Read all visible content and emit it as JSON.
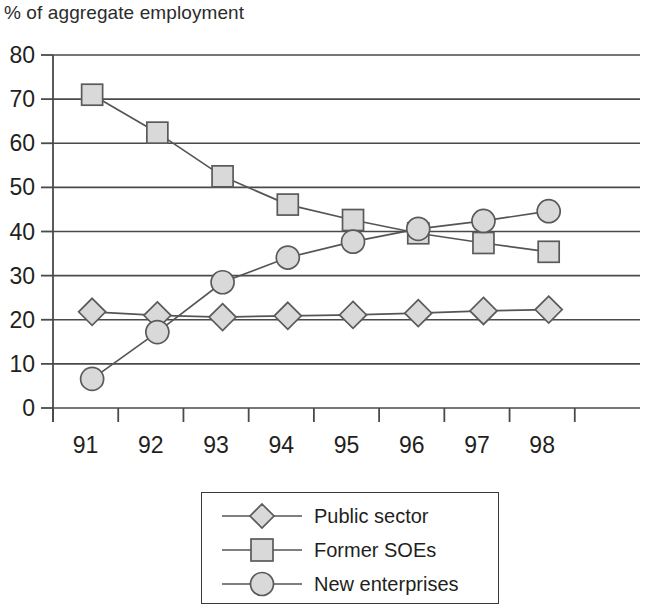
{
  "chart_data": {
    "type": "line",
    "title": "% of aggregate employment",
    "xlabel": "",
    "ylabel": "",
    "categories": [
      "91",
      "92",
      "93",
      "94",
      "95",
      "96",
      "97",
      "98"
    ],
    "ylim": [
      0,
      80
    ],
    "y_ticks": [
      0,
      10,
      20,
      30,
      40,
      50,
      60,
      70,
      80
    ],
    "grid": true,
    "legend_position": "bottom-center",
    "series": [
      {
        "name": "Public sector",
        "marker": "diamond",
        "values": [
          21.8,
          21.0,
          20.6,
          20.9,
          21.1,
          21.5,
          22.0,
          22.3
        ]
      },
      {
        "name": "Former SOEs",
        "marker": "square",
        "values": [
          71.0,
          62.4,
          52.5,
          46.1,
          42.6,
          39.6,
          37.4,
          35.4
        ]
      },
      {
        "name": "New enterprises",
        "marker": "circle",
        "values": [
          6.6,
          17.2,
          28.5,
          34.1,
          37.7,
          40.6,
          42.4,
          44.6
        ]
      }
    ]
  },
  "axis": {
    "y_tick_labels": [
      "80",
      "70",
      "60",
      "50",
      "40",
      "30",
      "20",
      "10",
      "0"
    ],
    "x_tick_labels": [
      "91",
      "92",
      "93",
      "94",
      "95",
      "96",
      "97",
      "98"
    ]
  },
  "legend": {
    "items": [
      {
        "label": "Public sector",
        "marker": "diamond"
      },
      {
        "label": "Former SOEs",
        "marker": "square"
      },
      {
        "label": "New enterprises",
        "marker": "circle"
      }
    ]
  },
  "colors": {
    "marker_fill": "#d9d9d9",
    "marker_stroke": "#5a5a5a",
    "line": "#555555",
    "grid": "#4a4a4a",
    "text": "#231f20"
  }
}
